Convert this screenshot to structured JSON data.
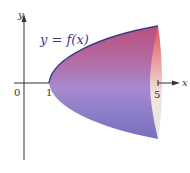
{
  "figure": {
    "function_label": "y = f(x)",
    "x_axis_label": "x",
    "y_axis_label": "y",
    "origin_label": "0",
    "tick_labels": [
      "1",
      "5"
    ]
  },
  "colors": {
    "surface_top": "#c0567e",
    "surface_mid": "#a77ac0",
    "surface_bottom": "#7f76c4",
    "curve": "#3a3a8a",
    "cap_light": "#f0e8e0",
    "cap_red": "#e05a5a",
    "axis": "#333333"
  }
}
